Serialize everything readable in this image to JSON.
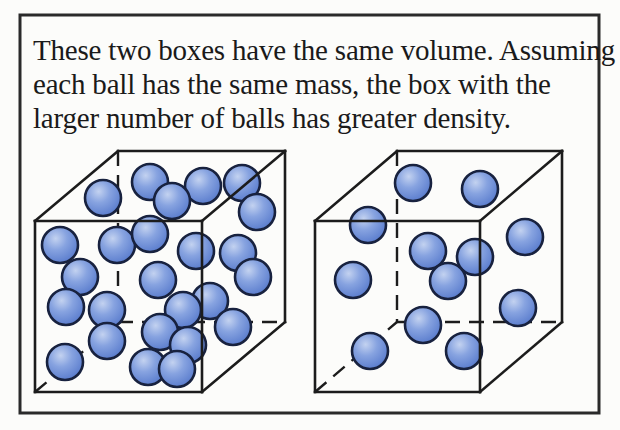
{
  "caption": {
    "lines": [
      "These two boxes have the same volume. Assuming",
      "each ball has the same mass, the box with the",
      "larger number of balls has greater density."
    ]
  },
  "diagram": {
    "type": "density-comparison-boxes",
    "colors": {
      "background": "#fcfcfa",
      "text": "#1a1a1a",
      "frame": "#2a2a2a",
      "edge": "#1c1c1c",
      "ball_outline": "#18223f",
      "ball_highlight": "#c3d2f0",
      "ball_mid": "#87a3e0",
      "ball_shadow": "#5578cb"
    },
    "frame": {
      "x": 20,
      "y": 15,
      "width": 579,
      "height": 398
    },
    "ball_radius": 18,
    "boxes": [
      {
        "name": "left-box-more-balls",
        "ball_count": 25,
        "front": {
          "x1": 35,
          "y1": 221,
          "x2": 202,
          "y2": 392
        },
        "depth": {
          "dx": 83,
          "dy": -70
        },
        "balls": [
          [
            103,
            198
          ],
          [
            150,
            182
          ],
          [
            203,
            186
          ],
          [
            242,
            183
          ],
          [
            257,
            212
          ],
          [
            172,
            201
          ],
          [
            60,
            245
          ],
          [
            117,
            245
          ],
          [
            150,
            234
          ],
          [
            196,
            251
          ],
          [
            238,
            253
          ],
          [
            80,
            277
          ],
          [
            158,
            280
          ],
          [
            253,
            277
          ],
          [
            210,
            301
          ],
          [
            183,
            310
          ],
          [
            233,
            327
          ],
          [
            66,
            307
          ],
          [
            107,
            310
          ],
          [
            107,
            341
          ],
          [
            160,
            332
          ],
          [
            188,
            345
          ],
          [
            65,
            362
          ],
          [
            148,
            367
          ],
          [
            177,
            369
          ]
        ]
      },
      {
        "name": "right-box-fewer-balls",
        "ball_count": 12,
        "front": {
          "x1": 315,
          "y1": 221,
          "x2": 480,
          "y2": 392
        },
        "depth": {
          "dx": 82,
          "dy": -70
        },
        "balls": [
          [
            413,
            183
          ],
          [
            480,
            189
          ],
          [
            368,
            225
          ],
          [
            428,
            251
          ],
          [
            475,
            257
          ],
          [
            525,
            237
          ],
          [
            353,
            280
          ],
          [
            448,
            281
          ],
          [
            423,
            325
          ],
          [
            518,
            308
          ],
          [
            370,
            351
          ],
          [
            464,
            351
          ]
        ]
      }
    ]
  }
}
